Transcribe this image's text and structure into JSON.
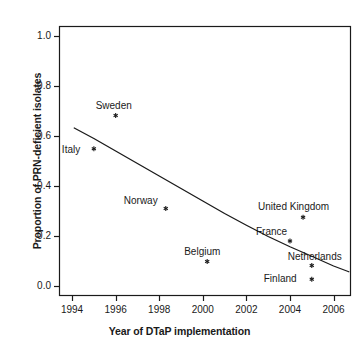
{
  "chart_data": {
    "type": "scatter",
    "title": "",
    "xlabel": "Year of DTaP implementation",
    "ylabel": "Proportion of PRN-deficient isolates",
    "xlim": [
      1993.4,
      2006.8
    ],
    "ylim": [
      -0.04,
      1.04
    ],
    "grid": false,
    "legend": "none",
    "xticks": [
      1994,
      1996,
      1998,
      2000,
      2002,
      2004,
      2006
    ],
    "xtick_labels": [
      "1994",
      "1996",
      "1998",
      "2000",
      "2002",
      "2004",
      "2006"
    ],
    "yticks": [
      0.0,
      0.2,
      0.4,
      0.6,
      0.8,
      1.0
    ],
    "ytick_labels": [
      "0.0",
      "0.2",
      "0.4",
      "0.6",
      "0.8",
      "1.0"
    ],
    "marker": "star",
    "marker_color": "#1a1a1a",
    "points": [
      {
        "label": "Italy",
        "x": 1995.0,
        "y": 0.549,
        "label_dx": -32,
        "label_dy": -4
      },
      {
        "label": "Sweden",
        "x": 1996.0,
        "y": 0.682,
        "label_dx": -20,
        "label_dy": -15
      },
      {
        "label": "Norway",
        "x": 1998.3,
        "y": 0.31,
        "label_dx": -42,
        "label_dy": -13
      },
      {
        "label": "Belgium",
        "x": 2000.2,
        "y": 0.098,
        "label_dx": -23,
        "label_dy": -15
      },
      {
        "label": "United Kingdom",
        "x": 2004.6,
        "y": 0.275,
        "label_dx": -45,
        "label_dy": -15
      },
      {
        "label": "France",
        "x": 2004.0,
        "y": 0.18,
        "label_dx": -34,
        "label_dy": -14
      },
      {
        "label": "Netherlands",
        "x": 2005.0,
        "y": 0.082,
        "label_dx": -24,
        "label_dy": -14
      },
      {
        "label": "Finland",
        "x": 2005.0,
        "y": 0.027,
        "label_dx": -48,
        "label_dy": -5
      }
    ],
    "trend_line": {
      "name": "fitted decay curve",
      "color": "#1a1a1a",
      "x": [
        1994.1,
        1995.0,
        1996.0,
        1997.0,
        1998.0,
        1999.0,
        2000.0,
        2001.0,
        2002.0,
        2003.0,
        2004.0,
        2005.0,
        2006.0,
        2006.7
      ],
      "y": [
        0.632,
        0.59,
        0.54,
        0.49,
        0.44,
        0.39,
        0.34,
        0.29,
        0.243,
        0.198,
        0.157,
        0.119,
        0.08,
        0.057
      ]
    }
  },
  "figure": {
    "background": "#ffffff",
    "axis_color": "#1a1a1a"
  }
}
